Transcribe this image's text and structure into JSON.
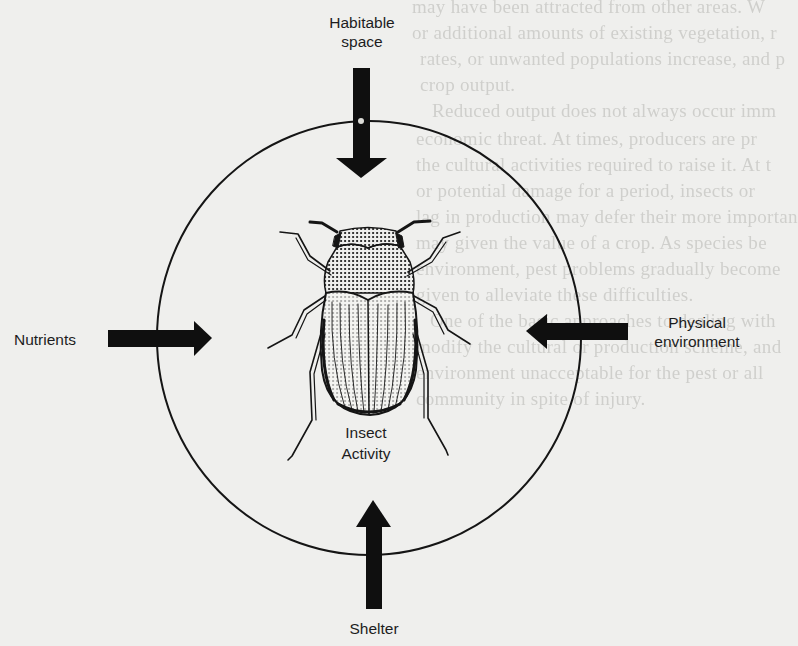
{
  "diagram": {
    "center_label": [
      "Insect",
      "Activity"
    ],
    "inputs": [
      {
        "id": "habitable-space",
        "label": [
          "Habitable",
          "space"
        ],
        "direction": "down",
        "position": "top"
      },
      {
        "id": "physical-environment",
        "label": [
          "Physical",
          "environment"
        ],
        "direction": "left",
        "position": "right"
      },
      {
        "id": "nutrients",
        "label": [
          "Nutrients"
        ],
        "direction": "right",
        "position": "left"
      },
      {
        "id": "shelter",
        "label": [
          "Shelter"
        ],
        "direction": "up",
        "position": "bottom"
      }
    ],
    "colors": {
      "ink": "#111111",
      "paper": "#efefed",
      "bleed_text": "#b6b6b2"
    }
  },
  "bleed_through_text": [
    "may have been attracted from other areas. W",
    "or additional amounts of existing vegetation, r",
    "rates, or unwanted populations increase, and p",
    "crop output.",
    "Reduced output does not always occur imm",
    "economic threat. At times, producers are pr",
    "the cultural activities required to raise it. At t",
    "or potential damage for a period, insects or",
    "lag in production may defer their more importan",
    "may given the value of a crop. As species be",
    "environment, pest problems gradually become",
    "given to alleviate these difficulties.",
    "One of the basic approaches to dealing with",
    "modify the cultural or production scheme, and",
    "environment unacceptable for the pest or all",
    "community in spite of injury."
  ]
}
